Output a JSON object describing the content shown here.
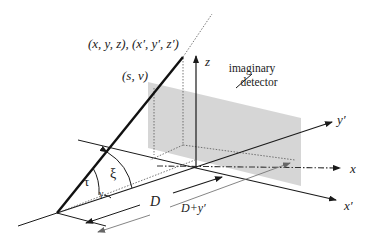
{
  "diagram": {
    "labels": {
      "point_coords": "(x, y, z), (x′, y′, z′)",
      "detector_coords": "(s, v)",
      "z_axis": "z",
      "detector_line1": "imaginary",
      "detector_line2": "detector",
      "y_prime_axis": "y′",
      "x_axis": "x",
      "x_prime_axis": "x′",
      "tau": "τ",
      "xi": "ξ",
      "gamma": "γ",
      "distance_D": "D",
      "distance_D_plus_y": "D+y′"
    },
    "colors": {
      "line": "#1a1a1a",
      "detector_fill": "#cfcfcf",
      "text": "#222222",
      "gray_label": "#777777"
    }
  }
}
